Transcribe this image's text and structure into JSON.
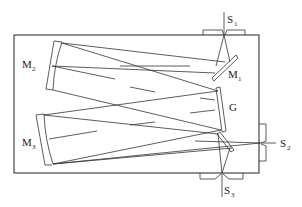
{
  "diagram": {
    "labels": {
      "M1": {
        "main": "M",
        "sub": "1"
      },
      "M2": {
        "main": "M",
        "sub": "2"
      },
      "M3": {
        "main": "M",
        "sub": "3"
      },
      "G": {
        "main": "G",
        "sub": ""
      },
      "S1": {
        "main": "S",
        "sub": "1"
      },
      "S2": {
        "main": "S",
        "sub": "2"
      },
      "S3": {
        "main": "S",
        "sub": "3"
      }
    },
    "components": [
      {
        "id": "M1",
        "type": "flat-mirror"
      },
      {
        "id": "M2",
        "type": "concave-mirror"
      },
      {
        "id": "M3",
        "type": "concave-mirror"
      },
      {
        "id": "G",
        "type": "grating"
      },
      {
        "id": "S1",
        "type": "slit"
      },
      {
        "id": "S2",
        "type": "slit"
      },
      {
        "id": "S3",
        "type": "slit"
      }
    ],
    "colors": {
      "line": "#333333",
      "background": "#ffffff"
    }
  }
}
